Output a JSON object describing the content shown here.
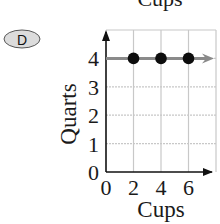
{
  "option_badge": {
    "label": "D"
  },
  "clipped_top_label": "Cups",
  "chart_data": {
    "type": "scatter",
    "title": "",
    "xlabel": "Cups",
    "ylabel": "Quarts",
    "xlim": [
      0,
      8
    ],
    "ylim": [
      0,
      5
    ],
    "x_ticks": [
      0,
      2,
      4,
      6
    ],
    "y_ticks": [
      0,
      1,
      2,
      3,
      4
    ],
    "grid": true,
    "points": [
      {
        "x": 2,
        "y": 4
      },
      {
        "x": 4,
        "y": 4
      },
      {
        "x": 6,
        "y": 4
      }
    ],
    "ray": {
      "from_x": 0,
      "y": 4,
      "direction": "right"
    },
    "colors": {
      "axis": "#111111",
      "grid": "#c8c8c8",
      "points": "#0d0d0d",
      "ray": "#8a8a8a",
      "badge_fill": "#dcdcdc"
    }
  }
}
